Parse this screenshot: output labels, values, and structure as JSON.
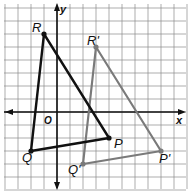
{
  "axes": {
    "x_label": "x",
    "y_label": "y",
    "origin_label": "O"
  },
  "grid": {
    "spacing_px": 13,
    "origin_px": [
      57,
      112
    ],
    "color": "#8a8a8a"
  },
  "colors": {
    "original": "#111111",
    "image": "#7a7a7a",
    "axis": "#111111"
  },
  "original_triangle": {
    "name": "PQR",
    "vertices": [
      {
        "label": "R",
        "x": -1,
        "y": 6
      },
      {
        "label": "Q",
        "x": -2,
        "y": -3
      },
      {
        "label": "P",
        "x": 4,
        "y": -2
      }
    ]
  },
  "image_triangle": {
    "name": "P'Q'R'",
    "vertices": [
      {
        "label": "R'",
        "x": 3,
        "y": 5
      },
      {
        "label": "Q'",
        "x": 2,
        "y": -4
      },
      {
        "label": "P'",
        "x": 8,
        "y": -3
      }
    ]
  }
}
